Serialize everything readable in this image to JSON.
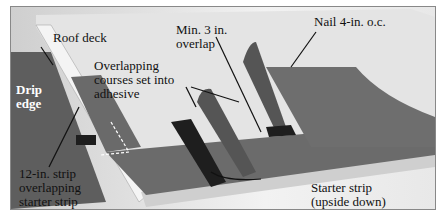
{
  "labels": {
    "roof_deck": "Roof deck",
    "min_overlap_1": "Min. 3 in.",
    "min_overlap_2": "overlap",
    "nail": "Nail 4-in. o.c.",
    "overlapping_1": "Overlapping",
    "overlapping_2": "courses set into",
    "overlapping_3": "adhesive",
    "drip_1": "Drip",
    "drip_2": "edge",
    "strip_1": "12-in. strip",
    "strip_2": "overlapping",
    "strip_3": "starter strip",
    "starter_1": "Starter strip",
    "starter_2": "(upside down)"
  },
  "colors": {
    "deck": "#e6e6e6",
    "membrane": "#6a6a6a",
    "adhesive": "#1e1e1e",
    "drip_edge": "#5a5a5a"
  }
}
